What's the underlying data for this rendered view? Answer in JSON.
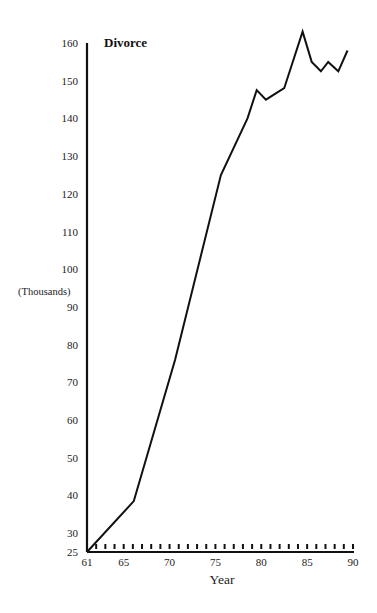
{
  "chart_data": {
    "type": "line",
    "title": "Divorce",
    "xlabel": "Year",
    "ylabel": "(Thousands)",
    "xlim": [
      61,
      90
    ],
    "ylim": [
      25,
      160
    ],
    "grid": false,
    "legend": null,
    "x_ticks": [
      "61",
      "65",
      "70",
      "75",
      "80",
      "85",
      "90"
    ],
    "x_tick_values": [
      61,
      65,
      70,
      75,
      80,
      85,
      90
    ],
    "minor_x_ticks": "every year 62-90",
    "y_ticks": [
      "25",
      "30",
      "40",
      "50",
      "60",
      "70",
      "80",
      "90",
      "100",
      "110",
      "120",
      "130",
      "140",
      "150",
      "160"
    ],
    "y_tick_values": [
      25,
      30,
      40,
      50,
      60,
      70,
      80,
      90,
      100,
      110,
      120,
      130,
      140,
      150,
      160
    ],
    "series": [
      {
        "name": "Divorce",
        "x": [
          61,
          66.1,
          70.6,
          75.6,
          78.5,
          79.5,
          80.5,
          82.5,
          84.5,
          85.5,
          86.5,
          87.3,
          88.4,
          89.4
        ],
        "values": [
          25,
          38.5,
          76,
          125,
          140,
          147.5,
          145,
          148,
          163,
          155,
          152.5,
          155,
          152.5,
          158
        ]
      }
    ]
  },
  "labels": {
    "title": "Divorce",
    "xlabel": "Year",
    "ylabel": "(Thousands)"
  },
  "colors": {
    "line": "#111111",
    "axis": "#111111",
    "background": "#ffffff"
  }
}
